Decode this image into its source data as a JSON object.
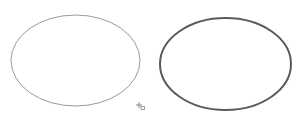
{
  "canvas": {
    "width": 298,
    "height": 130,
    "background": "#ffffff",
    "shapes": [
      {
        "type": "ellipse",
        "label": "ellipse-thin",
        "cx": 75.5,
        "cy": 60.5,
        "rx": 64.5,
        "ry": 45.5,
        "stroke": "#9a9a9a",
        "stroke_width": 1,
        "fill": "none"
      },
      {
        "type": "ellipse",
        "label": "ellipse-thick",
        "cx": 225.5,
        "cy": 64,
        "rx": 65.5,
        "ry": 46,
        "stroke": "#5a5a5a",
        "stroke_width": 2,
        "fill": "none"
      }
    ],
    "cursor": {
      "icon": "crosshair-shape-cursor-icon",
      "x": 139,
      "y": 105,
      "color": "#888888"
    }
  }
}
